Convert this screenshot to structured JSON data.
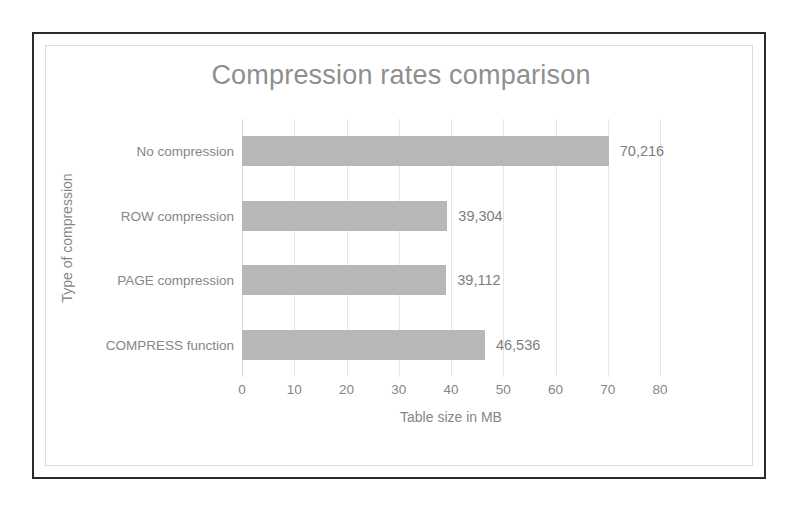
{
  "chart_data": {
    "type": "bar",
    "orientation": "horizontal",
    "title": "Compression rates comparison",
    "xlabel": "Table size in MB",
    "ylabel": "Type of compression",
    "categories": [
      "No compression",
      "ROW compression",
      "PAGE compression",
      "COMPRESS function"
    ],
    "values": [
      70216,
      39304,
      39112,
      46536
    ],
    "bar_extents_axis_units": [
      70.2,
      39.3,
      39.1,
      46.5
    ],
    "data_labels": [
      "70,216",
      "39,304",
      "39,112",
      "46,536"
    ],
    "xlim": [
      0,
      80
    ],
    "xticks": [
      0,
      10,
      20,
      30,
      40,
      50,
      60,
      70,
      80
    ],
    "xtick_labels": [
      "0",
      "10",
      "20",
      "30",
      "40",
      "50",
      "60",
      "70",
      "80"
    ],
    "grid": "vertical",
    "legend": "none",
    "series": [
      {
        "name": "Table size in MB",
        "values": [
          70216,
          39304,
          39112,
          46536
        ]
      }
    ],
    "colors": {
      "bar": "#b7b7b7",
      "title_text": "#8f8f8f",
      "axis_text": "#868686",
      "gridline": "#e6e6e6",
      "frame_outer": "#2b2b2b",
      "frame_inner": "#dcdcdc",
      "background": "#ffffff"
    }
  }
}
